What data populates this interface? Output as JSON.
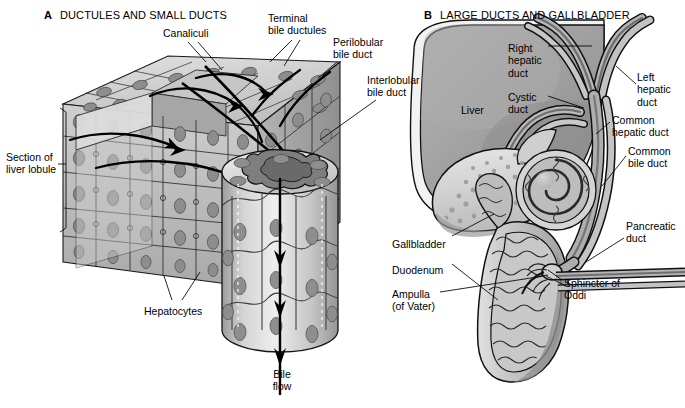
{
  "figure": {
    "width": 685,
    "height": 408,
    "background": "#ffffff"
  },
  "colors": {
    "ink": "#000000",
    "liver_fill": "#9a9a9a",
    "liver_fill_light": "#b8b8b8",
    "gallbladder_fill": "#c9c9c9",
    "gallbladder_highlight": "#e2e2e2",
    "duct_fill": "#8e8e8e",
    "cell_light": "#d8d8d8",
    "cell_mid": "#b4b4b4",
    "cell_dark": "#8d8d8d",
    "nucleus": "#8a8a8a",
    "duodenum_fill": "#bdbdbd",
    "white": "#ffffff"
  },
  "panels": [
    {
      "id": "A",
      "letter": "A",
      "title": "DUCTULES AND SMALL DUCTS",
      "letter_x": 44,
      "letter_y": 9,
      "title_x": 60,
      "title_y": 9
    },
    {
      "id": "B",
      "letter": "B",
      "title": "LARGE DUCTS AND GALLBLADDER",
      "letter_x": 424,
      "letter_y": 9,
      "title_x": 440,
      "title_y": 9
    }
  ],
  "panel_a": {
    "labels": [
      {
        "name": "canaliculi",
        "text": "Canaliculi",
        "lines": [
          "Canaliculi"
        ],
        "x": 163,
        "y": 27,
        "align": "left"
      },
      {
        "name": "terminal-bile-ductules",
        "text": "Terminal bile ductules",
        "lines": [
          "Terminal",
          "bile ductules"
        ],
        "x": 268,
        "y": 12,
        "align": "left"
      },
      {
        "name": "perilobular-bile-duct",
        "text": "Perilobular bile duct",
        "lines": [
          "Perilobular",
          "bile duct"
        ],
        "x": 333,
        "y": 36,
        "align": "left"
      },
      {
        "name": "interlobular-bile-duct",
        "text": "Interlobular bile duct",
        "lines": [
          "Interlobular",
          "bile duct"
        ],
        "x": 367,
        "y": 74,
        "align": "left"
      },
      {
        "name": "section-of-liver-lobule",
        "text": "Section of liver lobule",
        "lines": [
          "Section of",
          "liver lobule"
        ],
        "x": 6,
        "y": 151,
        "align": "left"
      },
      {
        "name": "hepatocytes",
        "text": "Hepatocytes",
        "lines": [
          "Hepatocytes"
        ],
        "x": 144,
        "y": 305,
        "align": "left"
      },
      {
        "name": "bile-flow",
        "text": "Bile flow",
        "lines": [
          "Bile",
          "flow"
        ],
        "x": 273,
        "y": 368,
        "align": "left"
      }
    ]
  },
  "panel_b": {
    "labels": [
      {
        "name": "right-hepatic-duct",
        "text": "Right hepatic duct",
        "lines": [
          "Right",
          "hepatic",
          "duct"
        ],
        "x": 508,
        "y": 42,
        "align": "left"
      },
      {
        "name": "left-hepatic-duct",
        "text": "Left hepatic duct",
        "lines": [
          "Left",
          "hepatic",
          "duct"
        ],
        "x": 637,
        "y": 71,
        "align": "left"
      },
      {
        "name": "liver",
        "text": "Liver",
        "lines": [
          "Liver"
        ],
        "x": 461,
        "y": 104,
        "align": "left"
      },
      {
        "name": "cystic-duct",
        "text": "Cystic duct",
        "lines": [
          "Cystic",
          "duct"
        ],
        "x": 508,
        "y": 91,
        "align": "left"
      },
      {
        "name": "common-hepatic-duct",
        "text": "Common hepatic duct",
        "lines": [
          "Common",
          "hepatic duct"
        ],
        "x": 612,
        "y": 114,
        "align": "left"
      },
      {
        "name": "common-bile-duct",
        "text": "Common bile duct",
        "lines": [
          "Common",
          "bile duct"
        ],
        "x": 628,
        "y": 145,
        "align": "left"
      },
      {
        "name": "pancreatic-duct",
        "text": "Pancreatic duct",
        "lines": [
          "Pancreatic",
          "duct"
        ],
        "x": 626,
        "y": 220,
        "align": "left"
      },
      {
        "name": "gallbladder",
        "text": "Gallbladder",
        "lines": [
          "Gallbladder"
        ],
        "x": 392,
        "y": 238,
        "align": "left"
      },
      {
        "name": "duodenum",
        "text": "Duodenum",
        "lines": [
          "Duodenum"
        ],
        "x": 392,
        "y": 264,
        "align": "left"
      },
      {
        "name": "ampulla-of-vater",
        "text": "Ampulla (of Vater)",
        "lines": [
          "Ampulla",
          "(of Vater)"
        ],
        "x": 392,
        "y": 288,
        "align": "left"
      },
      {
        "name": "sphincter-of-oddi",
        "text": "Sphincter of Oddi",
        "lines": [
          "Sphincter of",
          "Oddi"
        ],
        "x": 564,
        "y": 277,
        "align": "left"
      }
    ]
  }
}
